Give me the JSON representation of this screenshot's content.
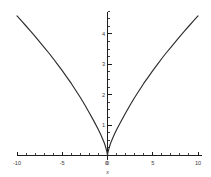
{
  "chart_data": {
    "type": "line",
    "title": "",
    "subtitle": "",
    "xlabel": "x",
    "ylabel": "",
    "grid": false,
    "legend": null,
    "xlim": [
      -10,
      10
    ],
    "ylim": [
      0,
      4.8
    ],
    "x_ticks_major": [
      -10,
      -5,
      0,
      5,
      10
    ],
    "x_tick_labels": [
      "-10",
      "-5",
      "0",
      "5",
      "10"
    ],
    "x_tick_minor_step": 1,
    "y_ticks_major": [
      1,
      2,
      3,
      4
    ],
    "y_tick_labels": [
      "1",
      "2",
      "3",
      "4"
    ],
    "y_tick_minor_step": 0.25,
    "series": [
      {
        "name": "curve",
        "color": "#2e2c2b",
        "x": [
          -10,
          -9.5,
          -9,
          -8.5,
          -8,
          -7.5,
          -7,
          -6.5,
          -6,
          -5.5,
          -5,
          -4.5,
          -4,
          -3.5,
          -3,
          -2.5,
          -2,
          -1.5,
          -1,
          -0.75,
          -0.5,
          -0.35,
          -0.25,
          -0.15,
          -0.08,
          -0.03,
          0,
          0.03,
          0.08,
          0.15,
          0.25,
          0.35,
          0.5,
          0.75,
          1,
          1.5,
          2,
          2.5,
          3,
          3.5,
          4,
          4.5,
          5,
          5.5,
          6,
          6.5,
          7,
          7.5,
          8,
          8.5,
          9,
          9.5,
          10
        ],
        "y": [
          4.59,
          4.43,
          4.26,
          4.09,
          3.92,
          3.74,
          3.56,
          3.38,
          3.19,
          2.99,
          2.79,
          2.58,
          2.37,
          2.14,
          1.91,
          1.66,
          1.4,
          1.13,
          0.85,
          0.69,
          0.52,
          0.41,
          0.32,
          0.22,
          0.14,
          0.07,
          0,
          0.07,
          0.14,
          0.22,
          0.32,
          0.41,
          0.52,
          0.69,
          0.85,
          1.13,
          1.4,
          1.66,
          1.91,
          2.14,
          2.37,
          2.58,
          2.79,
          2.99,
          3.19,
          3.38,
          3.56,
          3.74,
          3.92,
          4.09,
          4.26,
          4.43,
          4.59
        ]
      }
    ],
    "annotations": []
  },
  "axes": {
    "x_axis_label": "x",
    "origin_label": "0"
  }
}
